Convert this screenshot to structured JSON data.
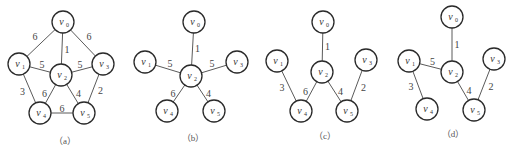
{
  "figure": {
    "graphs": [
      {
        "id": "a",
        "caption": "（a）",
        "nodes": [
          {
            "id": "v0",
            "name": "v",
            "sub": "0"
          },
          {
            "id": "v1",
            "name": "v",
            "sub": "1"
          },
          {
            "id": "v2",
            "name": "v",
            "sub": "2"
          },
          {
            "id": "v3",
            "name": "v",
            "sub": "3"
          },
          {
            "id": "v4",
            "name": "v",
            "sub": "4"
          },
          {
            "id": "v5",
            "name": "v",
            "sub": "5"
          }
        ],
        "edges": [
          {
            "from": "v0",
            "to": "v1",
            "weight": "6"
          },
          {
            "from": "v0",
            "to": "v2",
            "weight": "1"
          },
          {
            "from": "v0",
            "to": "v3",
            "weight": "6"
          },
          {
            "from": "v1",
            "to": "v2",
            "weight": "5"
          },
          {
            "from": "v2",
            "to": "v3",
            "weight": "5"
          },
          {
            "from": "v1",
            "to": "v4",
            "weight": "3"
          },
          {
            "from": "v2",
            "to": "v4",
            "weight": "6"
          },
          {
            "from": "v2",
            "to": "v5",
            "weight": "4"
          },
          {
            "from": "v3",
            "to": "v5",
            "weight": "2"
          },
          {
            "from": "v4",
            "to": "v5",
            "weight": "6"
          }
        ]
      },
      {
        "id": "b",
        "caption": "（b）",
        "nodes": [
          {
            "id": "v0",
            "name": "v",
            "sub": "0"
          },
          {
            "id": "v1",
            "name": "v",
            "sub": "1"
          },
          {
            "id": "v2",
            "name": "v",
            "sub": "2"
          },
          {
            "id": "v3",
            "name": "v",
            "sub": "3"
          },
          {
            "id": "v4",
            "name": "v",
            "sub": "4"
          },
          {
            "id": "v5",
            "name": "v",
            "sub": "5"
          }
        ],
        "edges": [
          {
            "from": "v0",
            "to": "v2",
            "weight": "1"
          },
          {
            "from": "v1",
            "to": "v2",
            "weight": "5"
          },
          {
            "from": "v2",
            "to": "v3",
            "weight": "5"
          },
          {
            "from": "v2",
            "to": "v4",
            "weight": "6"
          },
          {
            "from": "v2",
            "to": "v5",
            "weight": "4"
          }
        ]
      },
      {
        "id": "c",
        "caption": "（c）",
        "nodes": [
          {
            "id": "v0",
            "name": "v",
            "sub": "0"
          },
          {
            "id": "v1",
            "name": "v",
            "sub": "1"
          },
          {
            "id": "v2",
            "name": "v",
            "sub": "2"
          },
          {
            "id": "v3",
            "name": "v",
            "sub": "3"
          },
          {
            "id": "v4",
            "name": "v",
            "sub": "4"
          },
          {
            "id": "v5",
            "name": "v",
            "sub": "5"
          }
        ],
        "edges": [
          {
            "from": "v0",
            "to": "v2",
            "weight": "1"
          },
          {
            "from": "v1",
            "to": "v4",
            "weight": "3"
          },
          {
            "from": "v2",
            "to": "v4",
            "weight": "6"
          },
          {
            "from": "v2",
            "to": "v5",
            "weight": "4"
          },
          {
            "from": "v3",
            "to": "v5",
            "weight": "2"
          }
        ]
      },
      {
        "id": "d",
        "caption": "（d）",
        "nodes": [
          {
            "id": "v0",
            "name": "v",
            "sub": "0"
          },
          {
            "id": "v1",
            "name": "v",
            "sub": "1"
          },
          {
            "id": "v2",
            "name": "v",
            "sub": "2"
          },
          {
            "id": "v3",
            "name": "v",
            "sub": "3"
          },
          {
            "id": "v4",
            "name": "v",
            "sub": "4"
          },
          {
            "id": "v5",
            "name": "v",
            "sub": "5"
          }
        ],
        "edges": [
          {
            "from": "v0",
            "to": "v2",
            "weight": "1"
          },
          {
            "from": "v1",
            "to": "v2",
            "weight": "5"
          },
          {
            "from": "v1",
            "to": "v4",
            "weight": "3"
          },
          {
            "from": "v2",
            "to": "v5",
            "weight": "4"
          },
          {
            "from": "v3",
            "to": "v5",
            "weight": "2"
          }
        ]
      }
    ]
  }
}
